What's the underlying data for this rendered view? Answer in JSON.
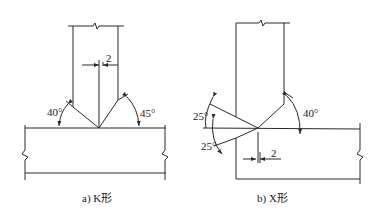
{
  "figures": [
    {
      "id": "a",
      "caption": "a) K形",
      "gap_label": "2",
      "angle_left": "40°",
      "angle_right": "45°"
    },
    {
      "id": "b",
      "caption": "b) X形",
      "gap_label": "2",
      "angle_upper_left": "25°",
      "angle_lower_left": "25°",
      "angle_right": "40°"
    }
  ]
}
